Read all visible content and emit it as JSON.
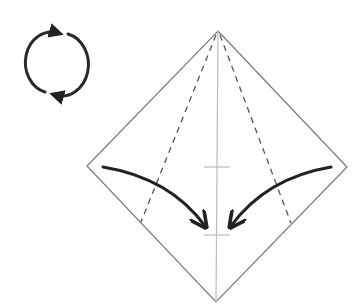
{
  "diagram": {
    "type": "origami-fold-step",
    "symbols": {
      "turn_over": {
        "icon": "rotate-turn-over-icon",
        "center": [
          48,
          63
        ],
        "radius": 22
      },
      "paper": {
        "shape": "square-diamond",
        "vertices": {
          "top": [
            218,
            31
          ],
          "left": [
            87,
            166
          ],
          "bottom": [
            216,
            302
          ],
          "right": [
            347,
            167
          ]
        }
      },
      "center_crease": {
        "from": [
          218,
          31
        ],
        "to": [
          216,
          302
        ],
        "style": "solid-light"
      },
      "valley_folds": [
        {
          "side": "left",
          "from": [
            216,
            35
          ],
          "to": [
            141,
            222
          ]
        },
        {
          "side": "right",
          "from": [
            220,
            35
          ],
          "to": [
            291,
            223
          ]
        }
      ],
      "reference_ticks": [
        {
          "y": 167,
          "x1": 204,
          "x2": 230
        },
        {
          "y": 235,
          "x1": 204,
          "x2": 230
        }
      ],
      "fold_arrows": [
        {
          "side": "left",
          "from": [
            103,
            167
          ],
          "to": [
            205,
            226
          ],
          "direction": "right-down"
        },
        {
          "side": "right",
          "from": [
            331,
            167
          ],
          "to": [
            231,
            226
          ],
          "direction": "left-down"
        }
      ]
    },
    "colors": {
      "outline": "#777777",
      "crease": "#bbbbbb",
      "valley": "#555555",
      "arrow": "#222222",
      "background": "#ffffff"
    }
  }
}
